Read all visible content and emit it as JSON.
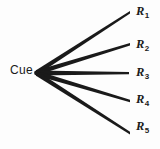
{
  "diagram": {
    "type": "fan-tree-diagram",
    "background_color": "#fdfdfd",
    "line_color": "#1a1a1a",
    "text_color": "#1a1a1a",
    "source_node": {
      "id": "cue",
      "label": "Cue",
      "x": 36,
      "y": 73
    },
    "branch_count": 5,
    "branches": [
      {
        "id": "r1",
        "label_base": "R",
        "label_sub": "1",
        "label_full": "R1",
        "from_x": 36,
        "from_y": 73,
        "to_x": 130,
        "to_y": 12,
        "label_x": 136,
        "label_y": 5
      },
      {
        "id": "r2",
        "label_base": "R",
        "label_sub": "2",
        "label_full": "R2",
        "from_x": 36,
        "from_y": 73,
        "to_x": 130,
        "to_y": 44,
        "label_x": 136,
        "label_y": 38
      },
      {
        "id": "r3",
        "label_base": "R",
        "label_sub": "3",
        "label_full": "R3",
        "from_x": 36,
        "from_y": 73,
        "to_x": 129,
        "to_y": 73,
        "label_x": 136,
        "label_y": 66
      },
      {
        "id": "r4",
        "label_base": "R",
        "label_sub": "4",
        "label_full": "R4",
        "from_x": 36,
        "from_y": 73,
        "to_x": 130,
        "to_y": 101,
        "label_x": 136,
        "label_y": 93
      },
      {
        "id": "r5",
        "label_base": "R",
        "label_sub": "5",
        "label_full": "R5",
        "from_x": 36,
        "from_y": 73,
        "to_x": 130,
        "to_y": 133,
        "label_x": 136,
        "label_y": 120
      }
    ]
  }
}
